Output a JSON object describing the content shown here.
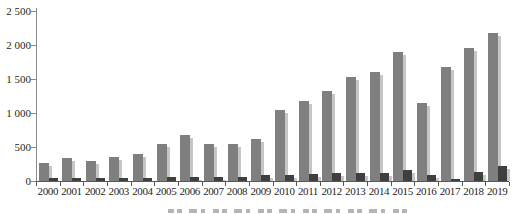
{
  "chart_data": {
    "type": "bar",
    "title": "",
    "xlabel": "",
    "ylabel": "",
    "categories": [
      "2000",
      "2001",
      "2002",
      "2003",
      "2004",
      "2005",
      "2006",
      "2007",
      "2008",
      "2009",
      "2010",
      "2011",
      "2012",
      "2013",
      "2014",
      "2015",
      "2016",
      "2017",
      "2018",
      "2019"
    ],
    "series": [
      {
        "name": "series-1",
        "color": "#7f7f7f",
        "shadow_color": "#c6c6c6",
        "values": [
          270,
          340,
          300,
          350,
          400,
          550,
          680,
          550,
          540,
          620,
          1040,
          1180,
          1320,
          1530,
          1600,
          1890,
          1140,
          1680,
          1960,
          2180
        ]
      },
      {
        "name": "series-2",
        "color": "#3f3f3f",
        "shadow_color": "#c6c6c6",
        "values": [
          45,
          45,
          45,
          40,
          45,
          55,
          60,
          60,
          55,
          90,
          90,
          105,
          125,
          120,
          120,
          155,
          85,
          35,
          135,
          220
        ]
      }
    ],
    "ylim": [
      0,
      2500
    ],
    "ytick_values": [
      2500,
      2000,
      1500,
      1000,
      500,
      0
    ],
    "ytick_labels": [
      "2 500",
      "2 000",
      "1 500",
      "1 000",
      "500",
      "0"
    ],
    "grid": false,
    "legend_position": "none",
    "background_color": "#ffffff",
    "note": "caption text at bottom edge is cut off and illegible"
  }
}
